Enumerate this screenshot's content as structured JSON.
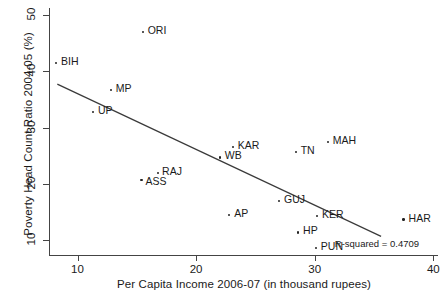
{
  "chart_data": {
    "type": "scatter",
    "title": "",
    "xlabel": "Per Capita Income 2006-07 (in thousand rupees)",
    "ylabel": "Poverty Head Count Ratio 2004-05 (%)",
    "xlim": [
      7.6,
      40.4
    ],
    "ylim": [
      7.4,
      51.2
    ],
    "xticks": [
      10,
      20,
      30,
      40
    ],
    "xtick_labels": [
      "10",
      "20",
      "30",
      "40"
    ],
    "yticks": [
      10,
      20,
      30,
      40,
      50
    ],
    "ytick_labels": [
      "10",
      "20",
      "30",
      "40",
      "50"
    ],
    "grid": false,
    "legend": false,
    "annotations": [
      {
        "name": "r-squared",
        "text": "R-squared = 0.4709",
        "x": 34.4,
        "y": 9.4
      }
    ],
    "fit_line": {
      "name": "linear-regression-line",
      "x_start": 8.3,
      "y_start": 37.7,
      "x_end": 35.6,
      "y_end": 10.7
    },
    "points": [
      {
        "label": "ORI",
        "x": 15.5,
        "y": 46.9,
        "label_dx": 5,
        "label_dy": -4
      },
      {
        "label": "BIH",
        "x": 8.2,
        "y": 41.4,
        "label_dx": 5,
        "label_dy": -4
      },
      {
        "label": "MP",
        "x": 12.8,
        "y": 36.7,
        "label_dx": 5,
        "label_dy": -4
      },
      {
        "label": "UP",
        "x": 11.3,
        "y": 32.8,
        "label_dx": 5,
        "label_dy": -4
      },
      {
        "label": "KAR",
        "x": 23.1,
        "y": 26.6,
        "label_dx": 5,
        "label_dy": -4
      },
      {
        "label": "WB",
        "x": 22.0,
        "y": 24.7,
        "label_dx": 5,
        "label_dy": -4
      },
      {
        "label": "MAH",
        "x": 31.1,
        "y": 27.5,
        "label_dx": 5,
        "label_dy": -4
      },
      {
        "label": "TN",
        "x": 28.4,
        "y": 25.7,
        "label_dx": 5,
        "label_dy": -4
      },
      {
        "label": "RAJ",
        "x": 16.8,
        "y": 21.9,
        "label_dx": 4,
        "label_dy": -4
      },
      {
        "label": "ASS",
        "x": 15.4,
        "y": 20.7,
        "label_dx": 4,
        "label_dy": -1
      },
      {
        "label": "GUJ",
        "x": 27.0,
        "y": 17.0,
        "label_dx": 5,
        "label_dy": -4
      },
      {
        "label": "AP",
        "x": 22.8,
        "y": 14.5,
        "label_dx": 5,
        "label_dy": -4
      },
      {
        "label": "KER",
        "x": 30.2,
        "y": 14.3,
        "label_dx": 5,
        "label_dy": -4
      },
      {
        "label": "HAR",
        "x": 37.5,
        "y": 13.7,
        "label_dx": 5,
        "label_dy": -4
      },
      {
        "label": "HP",
        "x": 28.6,
        "y": 11.4,
        "label_dx": 5,
        "label_dy": -4
      },
      {
        "label": "PUN",
        "x": 30.1,
        "y": 8.7,
        "label_dx": 5,
        "label_dy": -4
      }
    ]
  },
  "colors": {
    "point": "#222222",
    "line": "#3a3a3a",
    "axis": "#444444",
    "text": "#1a1a1a",
    "background": "#ffffff"
  }
}
